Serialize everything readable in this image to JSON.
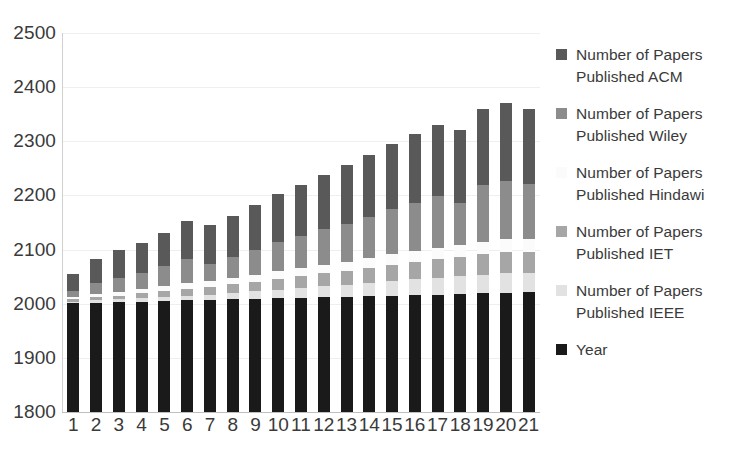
{
  "chart_data": {
    "type": "bar",
    "subtype": "stacked-column",
    "title": "",
    "xlabel": "",
    "ylabel": "",
    "categories": [
      "1",
      "2",
      "3",
      "4",
      "5",
      "6",
      "7",
      "8",
      "9",
      "10",
      "11",
      "12",
      "13",
      "14",
      "15",
      "16",
      "17",
      "18",
      "19",
      "20",
      "21"
    ],
    "ylim": [
      1800,
      2500
    ],
    "ytick_step": 100,
    "yticks": [
      "2500",
      "2400",
      "2300",
      "2200",
      "2100",
      "2000",
      "1900",
      "1800"
    ],
    "grid": true,
    "legend_position": "right",
    "stack_order_bottom_to_top": [
      "Year",
      "Number of Papers Published IEEE",
      "Number of Papers Published IET",
      "Number of Papers Published Hindawi",
      "Number of Papers Published Wiley",
      "Number of Papers Published ACM"
    ],
    "series": [
      {
        "name": "Year",
        "color": "#1a1a1a",
        "values": [
          2001,
          2002,
          2003,
          2004,
          2005,
          2006,
          2007,
          2008,
          2009,
          2010,
          2011,
          2012,
          2013,
          2014,
          2015,
          2016,
          2017,
          2018,
          2019,
          2020,
          2021
        ]
      },
      {
        "name": "Number of Papers Published IEEE",
        "color": "#e2e2e2",
        "values": [
          3,
          4,
          5,
          6,
          8,
          9,
          10,
          12,
          14,
          16,
          18,
          20,
          22,
          24,
          27,
          29,
          31,
          33,
          35,
          36,
          36
        ]
      },
      {
        "name": "Number of Papers Published IET",
        "color": "#a6a6a6",
        "values": [
          4,
          6,
          7,
          9,
          11,
          13,
          14,
          16,
          18,
          20,
          22,
          24,
          26,
          28,
          30,
          32,
          34,
          36,
          38,
          39,
          39
        ]
      },
      {
        "name": "Number of Papers Published Hindawi",
        "color": "#fbfbfb",
        "values": [
          5,
          6,
          7,
          8,
          9,
          10,
          11,
          12,
          13,
          14,
          15,
          16,
          17,
          18,
          19,
          20,
          21,
          22,
          23,
          24,
          24
        ]
      },
      {
        "name": "Number of Papers Published Wiley",
        "color": "#8c8c8c",
        "values": [
          10,
          20,
          26,
          30,
          36,
          44,
          32,
          38,
          46,
          54,
          60,
          66,
          70,
          76,
          84,
          90,
          96,
          78,
          104,
          108,
          102
        ]
      },
      {
        "name": "Number of Papers Published ACM",
        "color": "#595959",
        "values": [
          32,
          44,
          52,
          56,
          62,
          70,
          72,
          76,
          82,
          88,
          94,
          100,
          108,
          114,
          120,
          126,
          132,
          134,
          140,
          144,
          138
        ]
      }
    ],
    "totals": [
      2055,
      2082,
      2100,
      2123,
      2151,
      2167,
      2146,
      2168,
      2200,
      2222,
      2240,
      2262,
      2280,
      2284,
      2311,
      2329,
      2349,
      2329,
      2367,
      2375,
      2360
    ]
  },
  "legend": {
    "items": [
      {
        "label_line1": "Number of Papers",
        "label_line2": "Published ACM",
        "color": "#595959",
        "swatch": true
      },
      {
        "label_line1": "Number of Papers",
        "label_line2": "Published Wiley",
        "color": "#8c8c8c",
        "swatch": true
      },
      {
        "label_line1": "Number of Papers",
        "label_line2": "Published Hindawi",
        "color": "#fbfbfb",
        "swatch": true
      },
      {
        "label_line1": "Number of Papers",
        "label_line2": "Published IET",
        "color": "#a6a6a6",
        "swatch": true
      },
      {
        "label_line1": "Number of Papers",
        "label_line2": "Published IEEE",
        "color": "#e2e2e2",
        "swatch": true
      },
      {
        "label_line1": "Year",
        "label_line2": "",
        "color": "#1a1a1a",
        "swatch": true
      }
    ]
  }
}
